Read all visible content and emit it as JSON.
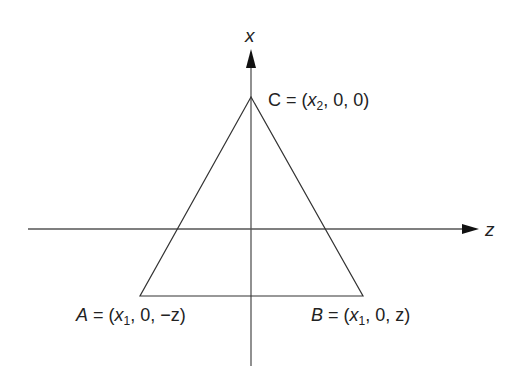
{
  "diagram": {
    "axes": {
      "vertical": {
        "label": "x"
      },
      "horizontal": {
        "label": "z"
      }
    },
    "points": {
      "C": {
        "name": "C",
        "eq": " = (",
        "var": "x",
        "sub": "2",
        "rest": ", 0, 0)"
      },
      "A": {
        "name": "A",
        "eq": " = (",
        "var": "x",
        "sub": "1",
        "rest": ", 0, −z)"
      },
      "B": {
        "name": "B",
        "eq": " = (",
        "var": "x",
        "sub": "1",
        "rest": ", 0, z)"
      }
    },
    "colors": {
      "line": "#333333",
      "axis": "#555555",
      "text": "#222222"
    }
  }
}
